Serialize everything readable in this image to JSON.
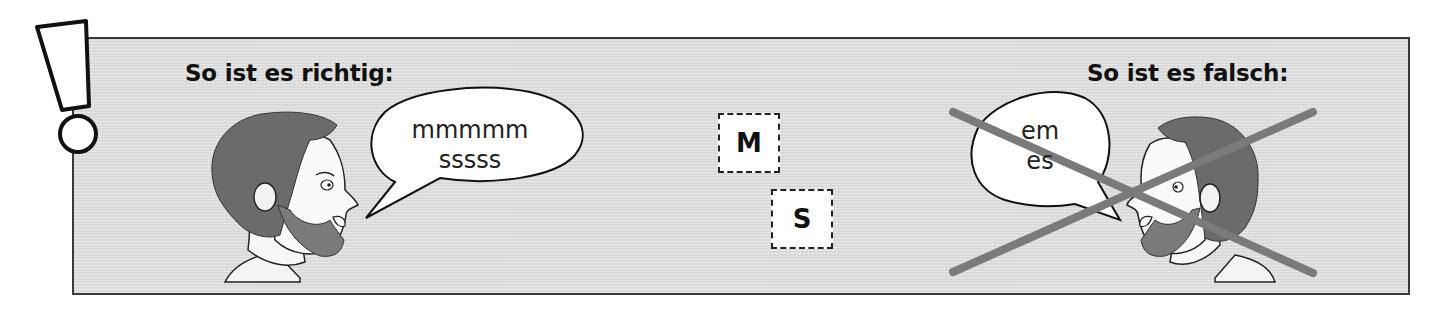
{
  "notice": {
    "icon": "exclamation-mark-icon"
  },
  "correct": {
    "heading": "So ist es richtig:",
    "speech_lines": [
      "mmmmm",
      "sssss"
    ],
    "illustration": "bearded-man-profile-facing-right"
  },
  "letters": [
    {
      "label": "M"
    },
    {
      "label": "S"
    }
  ],
  "wrong": {
    "heading": "So ist es falsch:",
    "speech_lines": [
      "em",
      "es"
    ],
    "illustration": "bearded-man-profile-facing-left",
    "cross_icon": "x-cross-icon",
    "cross_color": "#7a7a7a"
  },
  "colors": {
    "panel_bg": "#dcdcdc",
    "border": "#3a3a3a",
    "text": "#111111"
  }
}
